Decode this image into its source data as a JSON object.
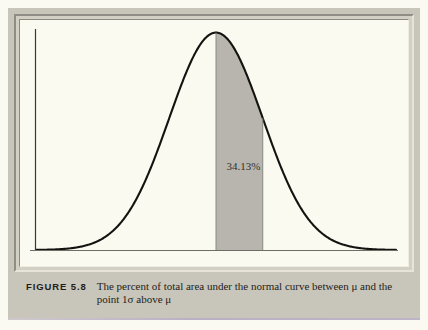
{
  "figure": {
    "label": "FIGURE 5.8",
    "caption": "The percent of total area under the normal curve between μ and the point 1σ above μ"
  },
  "colors": {
    "page_background": "#fbfaf2",
    "plate_background": "#c8c5bb",
    "chart_background": "#fbfaf0",
    "curve_stroke": "#151310",
    "shaded_area_fill": "#b8b5ae",
    "axis_stroke": "#3a3832",
    "text": "#1f1d19",
    "bottom_edge_accent": "#b9aec6"
  },
  "chart_data": {
    "type": "area",
    "title": "",
    "subtitle": "",
    "xlabel": "",
    "ylabel": "",
    "grid": false,
    "legend": null,
    "legend_position": "none",
    "distribution": "normal",
    "mean": 0,
    "std_dev": 1,
    "xlim": [
      -3.85,
      3.85
    ],
    "ylim": [
      0,
      0.4
    ],
    "tick_labels": [
      {
        "value": 0,
        "text": "μ"
      },
      {
        "value": 1,
        "text": "+1σ"
      }
    ],
    "shaded_region": {
      "from": 0,
      "to": 1,
      "label": "34.13%",
      "area_percent": 34.13,
      "fill": "#b8b5ae"
    },
    "annotations": [
      {
        "text": "34.13%",
        "x": 0.5,
        "y": 0.16
      }
    ],
    "x": [
      -3.8,
      -3.6,
      -3.4,
      -3.2,
      -3.0,
      -2.8,
      -2.6,
      -2.4,
      -2.2,
      -2.0,
      -1.8,
      -1.6,
      -1.4,
      -1.2,
      -1.0,
      -0.8,
      -0.6,
      -0.4,
      -0.2,
      0.0,
      0.2,
      0.4,
      0.6,
      0.8,
      1.0,
      1.2,
      1.4,
      1.6,
      1.8,
      2.0,
      2.2,
      2.4,
      2.6,
      2.8,
      3.0,
      3.2,
      3.4,
      3.6,
      3.8
    ],
    "y": [
      0.0003,
      0.0006,
      0.0012,
      0.0024,
      0.0044,
      0.0079,
      0.0136,
      0.0224,
      0.0355,
      0.054,
      0.079,
      0.1109,
      0.1497,
      0.1942,
      0.242,
      0.2897,
      0.3332,
      0.3683,
      0.391,
      0.3989,
      0.391,
      0.3683,
      0.3332,
      0.2897,
      0.242,
      0.1942,
      0.1497,
      0.1109,
      0.079,
      0.054,
      0.0355,
      0.0224,
      0.0136,
      0.0079,
      0.0044,
      0.0024,
      0.0012,
      0.0006,
      0.0003
    ]
  }
}
